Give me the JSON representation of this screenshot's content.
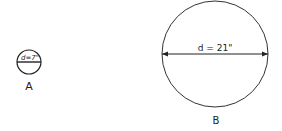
{
  "circles": [
    {
      "id": "A",
      "label": "A",
      "diameter_label": "d=7\"",
      "diameter_inches": 7
    },
    {
      "id": "B",
      "label": "B",
      "diameter_label": "d = 21\"",
      "diameter_inches": 21
    }
  ]
}
